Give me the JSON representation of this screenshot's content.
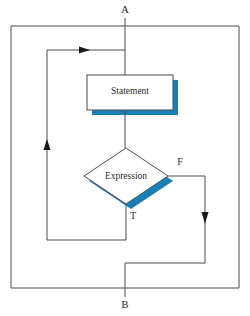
{
  "diagram": {
    "type": "flowchart",
    "colors": {
      "line": "#4a4a52",
      "shadow": "#1a7fb5",
      "text": "#2b2b2b",
      "node_fill": "#ffffff"
    },
    "terminals": [
      {
        "id": "entry",
        "label": "A",
        "x": 125,
        "y": 11
      },
      {
        "id": "exit",
        "label": "B",
        "x": 125,
        "y": 305
      }
    ],
    "nodes": [
      {
        "id": "statement",
        "shape": "rectangle",
        "label": "Statement",
        "x": 87,
        "y": 75,
        "w": 86,
        "h": 35
      },
      {
        "id": "expression",
        "shape": "diamond",
        "label": "Expression",
        "cx": 126,
        "cy": 176,
        "rx": 42,
        "ry": 28
      }
    ],
    "branches": [
      {
        "id": "true-branch",
        "label": "T",
        "x": 133,
        "y": 216
      },
      {
        "id": "false-branch",
        "label": "F",
        "x": 180,
        "y": 163
      }
    ],
    "edges": [
      {
        "id": "entry-to-statement",
        "from": "A",
        "to": "statement"
      },
      {
        "id": "statement-to-expression",
        "from": "statement",
        "to": "expression"
      },
      {
        "id": "expression-true-loopback",
        "from": "expression",
        "to": "statement",
        "label": "T"
      },
      {
        "id": "expression-false-to-exit",
        "from": "expression",
        "to": "B",
        "label": "F"
      }
    ],
    "arrows": [
      {
        "id": "loopback-arrow",
        "direction": "right",
        "x": 85,
        "y": 50
      },
      {
        "id": "loopback-up-arrow",
        "direction": "up",
        "x": 47,
        "y": 143
      },
      {
        "id": "false-down-arrow",
        "direction": "down",
        "x": 205,
        "y": 219
      }
    ]
  }
}
